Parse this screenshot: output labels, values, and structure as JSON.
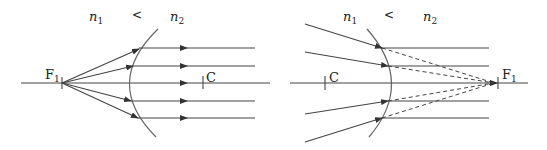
{
  "left_diagram": {
    "n1_label": "n",
    "n1_sub": "1",
    "relation": "<",
    "n2_label": "n",
    "n2_sub": "2",
    "focus_label": "F",
    "focus_sub": "1",
    "center_label": "C",
    "description": "Rays from focal point F1 in medium n1 refract at convex spherical surface and emerge parallel in medium n2"
  },
  "right_diagram": {
    "n1_label": "n",
    "n1_sub": "1",
    "relation": "<",
    "n2_label": "n",
    "n2_sub": "2",
    "focus_label": "F",
    "focus_sub": "1",
    "center_label": "C",
    "description": "Converging rays in medium n1 refract at concave spherical surface and emerge parallel; dashed extensions meet at virtual focal point F1"
  }
}
